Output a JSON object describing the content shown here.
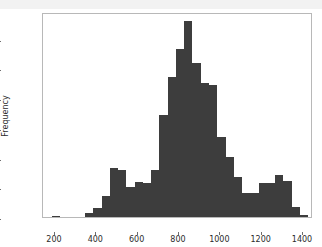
{
  "chart_data": {
    "type": "bar",
    "title": "",
    "xlabel": "",
    "ylabel": "Frequency",
    "xlim": [
      147,
      1453
    ],
    "ylim": [
      0,
      345
    ],
    "grid": false,
    "legend": null,
    "bin_width": 40,
    "bar_color": "#3d3d3d",
    "xticks": [
      200,
      400,
      600,
      800,
      1000,
      1200,
      1400
    ],
    "xtick_labels": [
      "200",
      "400",
      "600",
      "800",
      "1000",
      "1200",
      "1400"
    ],
    "yticks": [
      0,
      50,
      100,
      150,
      200,
      250,
      300
    ],
    "ytick_labels": [
      "0",
      "50",
      "100",
      "150",
      "200",
      "250",
      "300"
    ],
    "bins": [
      {
        "left": 190,
        "right": 230,
        "value": 2
      },
      {
        "left": 230,
        "right": 270,
        "value": 0
      },
      {
        "left": 270,
        "right": 310,
        "value": 0
      },
      {
        "left": 310,
        "right": 350,
        "value": 0
      },
      {
        "left": 350,
        "right": 390,
        "value": 7
      },
      {
        "left": 390,
        "right": 430,
        "value": 15
      },
      {
        "left": 430,
        "right": 470,
        "value": 35
      },
      {
        "left": 470,
        "right": 510,
        "value": 82
      },
      {
        "left": 510,
        "right": 550,
        "value": 79
      },
      {
        "left": 550,
        "right": 590,
        "value": 50
      },
      {
        "left": 590,
        "right": 630,
        "value": 59
      },
      {
        "left": 630,
        "right": 670,
        "value": 58
      },
      {
        "left": 670,
        "right": 710,
        "value": 79
      },
      {
        "left": 710,
        "right": 750,
        "value": 171
      },
      {
        "left": 750,
        "right": 790,
        "value": 235
      },
      {
        "left": 790,
        "right": 830,
        "value": 282
      },
      {
        "left": 830,
        "right": 870,
        "value": 330
      },
      {
        "left": 870,
        "right": 910,
        "value": 259
      },
      {
        "left": 910,
        "right": 950,
        "value": 226
      },
      {
        "left": 950,
        "right": 990,
        "value": 222
      },
      {
        "left": 990,
        "right": 1030,
        "value": 134
      },
      {
        "left": 1030,
        "right": 1070,
        "value": 101
      },
      {
        "left": 1070,
        "right": 1110,
        "value": 67
      },
      {
        "left": 1110,
        "right": 1150,
        "value": 40
      },
      {
        "left": 1150,
        "right": 1190,
        "value": 41
      },
      {
        "left": 1190,
        "right": 1230,
        "value": 57
      },
      {
        "left": 1230,
        "right": 1270,
        "value": 57
      },
      {
        "left": 1270,
        "right": 1310,
        "value": 70
      },
      {
        "left": 1310,
        "right": 1350,
        "value": 61
      },
      {
        "left": 1350,
        "right": 1390,
        "value": 17
      },
      {
        "left": 1390,
        "right": 1430,
        "value": 3
      }
    ]
  }
}
